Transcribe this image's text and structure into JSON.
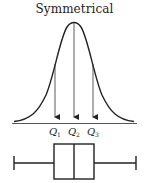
{
  "title": "Symmetrical",
  "curve": {
    "type": "normal-distribution",
    "peak_x": 74,
    "peak_y": 23,
    "baseline_y": 123
  },
  "quartiles": [
    {
      "label": "Q",
      "sub": "1",
      "x": 55
    },
    {
      "label": "Q",
      "sub": "2",
      "x": 74
    },
    {
      "label": "Q",
      "sub": "3",
      "x": 93
    }
  ],
  "boxplot": {
    "whisker_min_x": 14,
    "q1_x": 54,
    "median_x": 74,
    "q3_x": 94,
    "whisker_max_x": 136,
    "box_top": 144,
    "box_bottom": 179,
    "center_y": 163
  },
  "colors": {
    "stroke": "#222222",
    "background": "#ffffff"
  }
}
